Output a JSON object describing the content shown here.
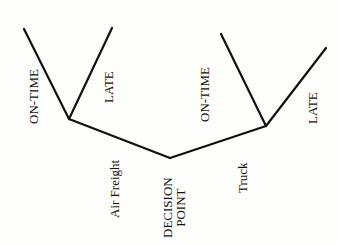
{
  "diagram": {
    "type": "decision-tree",
    "root": {
      "label_line1": "DECISION",
      "label_line2": "POINT"
    },
    "branches": [
      {
        "label": "Air Freight",
        "outcomes": [
          {
            "label": "ON-TIME"
          },
          {
            "label": "LATE"
          }
        ]
      },
      {
        "label": "Truck",
        "outcomes": [
          {
            "label": "ON-TIME"
          },
          {
            "label": "LATE"
          }
        ]
      }
    ],
    "line_color": "#111111",
    "background": "#fdfdfc"
  }
}
